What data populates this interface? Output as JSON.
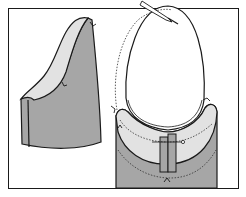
{
  "figure": {
    "title": "Sewing illustration: hood/collar piece and neckline facing assembly",
    "colors": {
      "background": "#ffffff",
      "frame": "#1a1a1a",
      "fabric_right_side": "#a6a6a6",
      "fabric_wrong_side": "#e2e2e2",
      "outline": "#1a1a1a",
      "stitch_line": "#333333"
    },
    "panels": [
      {
        "id": "left",
        "label": "Side piece, folded edge showing lining"
      },
      {
        "id": "right",
        "label": "Neckline opening with facing, dotted stitching lines and placket"
      }
    ]
  }
}
